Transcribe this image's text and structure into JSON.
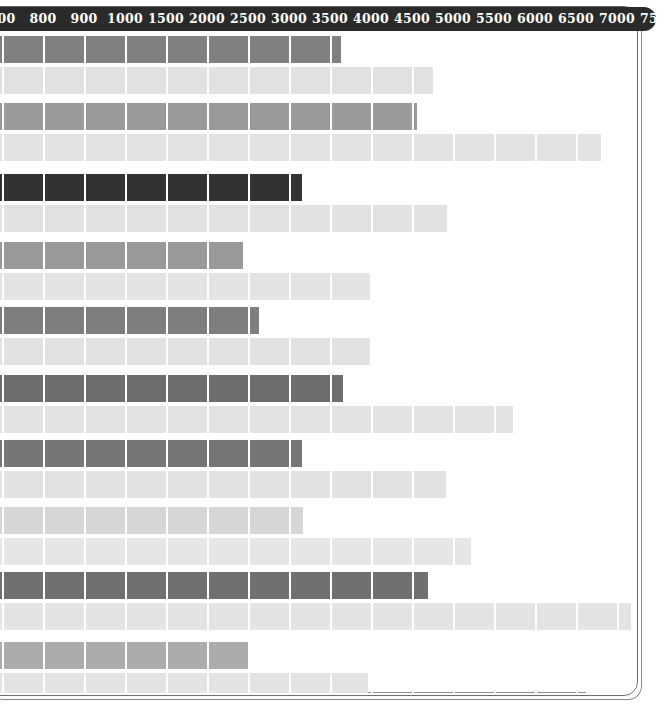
{
  "chart_data": {
    "type": "bar",
    "orientation": "horizontal",
    "title": "",
    "subtitle": "",
    "xlabel": "",
    "ylabel": "",
    "grid": true,
    "legend": null,
    "axis_position": "top",
    "axis_style": "dark-pill",
    "xlim": [
      700,
      7700
    ],
    "tick_labels": [
      "700",
      "800",
      "900",
      "1000",
      "1500",
      "2000",
      "2500",
      "3000",
      "3500",
      "4000",
      "4500",
      "5000",
      "5500",
      "6000",
      "6500",
      "7000",
      "7500"
    ],
    "tick_values": [
      700,
      800,
      900,
      1000,
      1500,
      2000,
      2500,
      3000,
      3500,
      4000,
      4500,
      5000,
      5500,
      6000,
      6500,
      7000,
      7500
    ],
    "categories": [
      "Group 1",
      "Group 2",
      "Group 3",
      "Group 4",
      "Group 5",
      "Group 6",
      "Group 7",
      "Group 8",
      "Group 9",
      "Group 10"
    ],
    "series": [
      {
        "name": "Primary",
        "color": "#808080",
        "values": [
          3500,
          4350,
          2900,
          2600,
          2800,
          3500,
          3200,
          3000,
          4450,
          2650
        ]
      },
      {
        "name": "Secondary",
        "color": "#e0e0e0",
        "values": [
          4450,
          6800,
          4650,
          4000,
          4000,
          5300,
          4500,
          4950,
          6900,
          3950
        ]
      }
    ],
    "bars": [
      {
        "row": 0,
        "series": "Primary",
        "value": 3500,
        "end_px": 341,
        "color": "#808080"
      },
      {
        "row": 1,
        "series": "Secondary",
        "value": 4450,
        "end_px": 433,
        "color": "#e1e1e1"
      },
      {
        "row": 2,
        "series": "Primary",
        "value": 4300,
        "end_px": 417,
        "color": "#9a9a9a"
      },
      {
        "row": 3,
        "series": "Secondary",
        "value": 6800,
        "end_px": 601,
        "color": "#e3e3e3"
      },
      {
        "row": 4,
        "series": "Primary",
        "value": 2900,
        "end_px": 302,
        "color": "#333333"
      },
      {
        "row": 5,
        "series": "Secondary",
        "value": 4650,
        "end_px": 447,
        "color": "#e2e2e2"
      },
      {
        "row": 6,
        "series": "Primary",
        "value": 2300,
        "end_px": 243,
        "color": "#999999"
      },
      {
        "row": 7,
        "series": "Secondary",
        "value": 3550,
        "end_px": 370,
        "color": "#e4e4e4"
      },
      {
        "row": 8,
        "series": "Primary",
        "value": 2600,
        "end_px": 259,
        "color": "#7e7e7e"
      },
      {
        "row": 9,
        "series": "Secondary",
        "value": 3550,
        "end_px": 370,
        "color": "#e2e2e2"
      },
      {
        "row": 10,
        "series": "Primary",
        "value": 3500,
        "end_px": 343,
        "color": "#6e6e6e"
      },
      {
        "row": 11,
        "series": "Secondary",
        "value": 5350,
        "end_px": 513,
        "color": "#e3e3e3"
      },
      {
        "row": 12,
        "series": "Primary",
        "value": 2900,
        "end_px": 302,
        "color": "#757575"
      },
      {
        "row": 13,
        "series": "Secondary",
        "value": 4600,
        "end_px": 446,
        "color": "#e2e2e2"
      },
      {
        "row": 14,
        "series": "Primary",
        "value": 2900,
        "end_px": 303,
        "color": "#d6d6d6"
      },
      {
        "row": 15,
        "series": "Secondary",
        "value": 4900,
        "end_px": 471,
        "color": "#e6e6e6"
      },
      {
        "row": 16,
        "series": "Primary",
        "value": 4450,
        "end_px": 428,
        "color": "#707070"
      },
      {
        "row": 17,
        "series": "Secondary",
        "value": 6950,
        "end_px": 631,
        "color": "#e4e4e4"
      },
      {
        "row": 18,
        "series": "Primary",
        "value": 2350,
        "end_px": 248,
        "color": "#acacac"
      },
      {
        "row": 19,
        "series": "Secondary",
        "value": 3500,
        "end_px": 368,
        "color": "#e4e4e4"
      }
    ]
  },
  "layout": {
    "gridline_start_px": 2,
    "gridline_spacing_px": 41,
    "gridline_count": 17,
    "bar_height_px": 27,
    "row_tops_px": [
      3,
      34,
      70,
      101,
      141,
      172,
      209,
      240,
      274,
      305,
      342,
      373,
      407,
      438,
      474,
      505,
      539,
      570,
      609,
      640
    ],
    "plot_top_px": 33,
    "axis_height_px": 24
  },
  "colors": {
    "axis_background": "#2a2a2a",
    "axis_text": "#ffffff",
    "gridline": "#ffffff",
    "frame_border": "#6d6d6d",
    "page_background": "#ffffff"
  }
}
